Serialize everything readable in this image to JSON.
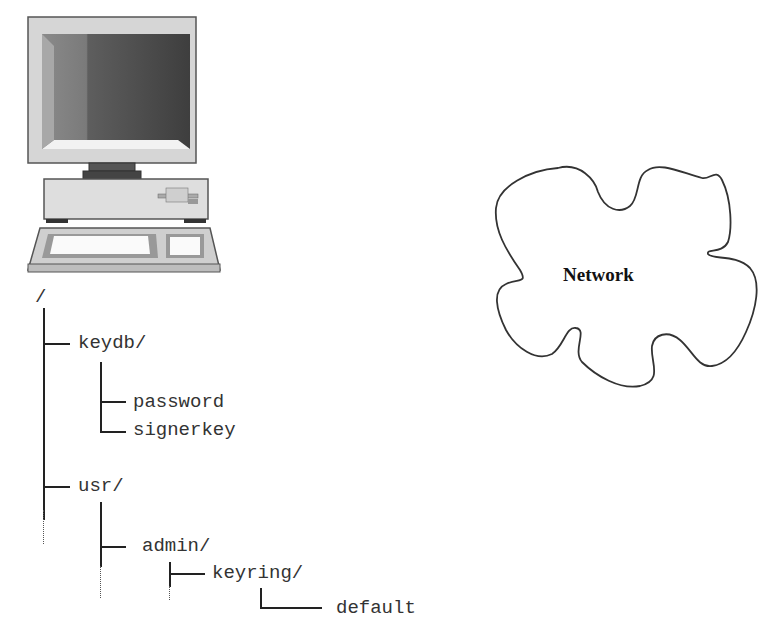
{
  "computer": {
    "icon": "desktop-computer-icon",
    "screen_color": "#5a5a5a",
    "case_color": "#d8d8d8"
  },
  "filesystem": {
    "root": "/",
    "items": [
      {
        "label": "keydb/",
        "depth": 1
      },
      {
        "label": "password",
        "depth": 2
      },
      {
        "label": "signerkey",
        "depth": 2
      },
      {
        "label": "usr/",
        "depth": 1
      },
      {
        "label": "admin/",
        "depth": 2
      },
      {
        "label": "keyring/",
        "depth": 3
      },
      {
        "label": "default",
        "depth": 4
      }
    ]
  },
  "network": {
    "label": "Network",
    "icon": "cloud-icon"
  }
}
